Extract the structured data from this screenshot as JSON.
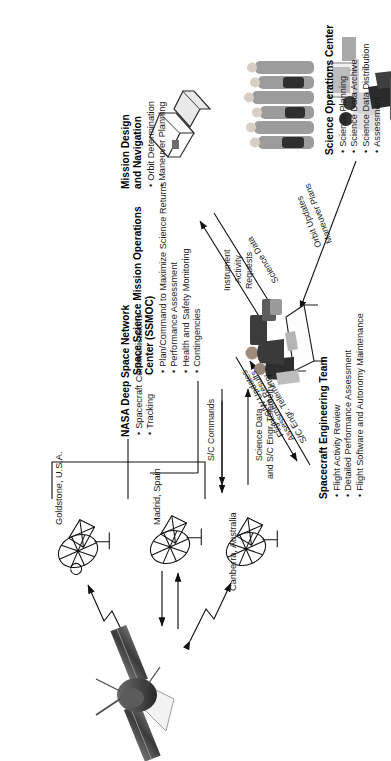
{
  "diagram": {
    "orientation": "rotated-90-ccw",
    "blocks": [
      {
        "id": "dsn",
        "title": "NASA Deep Space Network",
        "bullets": [
          "Spacecraft Communications",
          "Tracking"
        ]
      },
      {
        "id": "sc_eng",
        "title": "Spacecraft Engineering Team",
        "bullets": [
          "Flight Activity Review",
          "Detailed Performance Assessment",
          "Flight Software and Autonomy Maintenance"
        ]
      },
      {
        "id": "ssmoc",
        "title": "Space Science Mission Operations Center (SSMOC)",
        "title_line1": "Space Science Mission Operations",
        "title_line2": "Center (SSMOC)",
        "bullets": [
          "Plan/Command to Maximize Science Returns",
          "Performance Assessment",
          "Health and Safety Monitoring",
          "Contingencies"
        ]
      },
      {
        "id": "soc",
        "title": "Science Operations Center",
        "bullets": [
          "Science Planning",
          "Science Data Archive",
          "Science Data Distribution",
          "Assessment"
        ]
      },
      {
        "id": "mdn",
        "title": "Mission Design and Navigation",
        "title_line1": "Mission Design",
        "title_line2": "and Navigation",
        "bullets": [
          "Orbit Determination",
          "Maneuver Planning"
        ]
      }
    ],
    "dsn_sites": [
      {
        "id": "goldstone",
        "label": "Goldstone, U.S.A."
      },
      {
        "id": "madrid",
        "label": "Madrid, Spain"
      },
      {
        "id": "canberra",
        "label": "Canberra, Australia"
      }
    ],
    "flows": [
      {
        "id": "sc-commands",
        "label": "S/C Commands"
      },
      {
        "id": "science-data-telemetry",
        "line1": "Science Data",
        "line2": "and S/C Engr. Telemetry"
      },
      {
        "id": "sc-engr-telemetry",
        "label": "S/C Engr. Telemetry"
      },
      {
        "id": "assessment-results",
        "line1": "Assessment Results",
        "line2": "Flight S/W Updates"
      },
      {
        "id": "instrument-activity-requests",
        "line1": "Instrument",
        "line2": "Activity",
        "line3": "Requests"
      },
      {
        "id": "science-data",
        "label": "Science Data"
      },
      {
        "id": "orbit-updates",
        "line1": "Orbit Updates",
        "line2": "Maneuver Plans"
      }
    ],
    "figures": [
      {
        "id": "spacecraft",
        "name": "spacecraft-illustration"
      },
      {
        "id": "antenna-goldstone",
        "name": "dsn-antenna-icon"
      },
      {
        "id": "antenna-madrid",
        "name": "dsn-antenna-icon"
      },
      {
        "id": "antenna-canberra",
        "name": "dsn-antenna-icon"
      },
      {
        "id": "ssmoc-operators",
        "name": "operators-photo"
      },
      {
        "id": "soc-scientists",
        "name": "scientists-photo"
      },
      {
        "id": "soc-instrument",
        "name": "instrument-photo"
      },
      {
        "id": "navigators",
        "name": "navigators-photo"
      }
    ],
    "colors": {
      "ink": "#1b1b1b",
      "line": "#111111",
      "background": "#ffffff"
    }
  }
}
